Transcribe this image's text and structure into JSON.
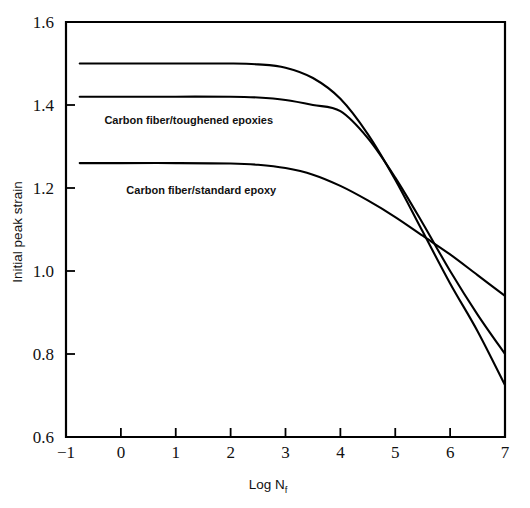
{
  "chart_data": {
    "type": "line",
    "title": "",
    "subtitle": "",
    "xlabel": "Log N",
    "xlabel_subscript": "f",
    "ylabel": "Initial peak strain",
    "xlim": [
      -1,
      7
    ],
    "ylim": [
      0.6,
      1.6
    ],
    "xticks": [
      -1,
      0,
      1,
      2,
      3,
      4,
      5,
      6,
      7
    ],
    "xtick_labels": [
      "−1",
      "0",
      "1",
      "2",
      "3",
      "4",
      "5",
      "6",
      "7"
    ],
    "yticks": [
      0.6,
      0.8,
      1.0,
      1.2,
      1.4,
      1.6
    ],
    "ytick_labels": [
      "0.6",
      "0.8",
      "1.0",
      "1.2",
      "1.4",
      "1.6"
    ],
    "grid": false,
    "legend_position": "inline-annotations",
    "line_color": "#000000",
    "background_color": "#ffffff",
    "annotations": [
      {
        "text": "Carbon fiber/toughened epoxies",
        "x": -0.3,
        "y": 1.355
      },
      {
        "text": "Carbon fiber/standard epoxy",
        "x": 0.1,
        "y": 1.185
      }
    ],
    "series": [
      {
        "name": "Carbon fiber/toughened epoxies (upper)",
        "plateau_value": 1.5,
        "x": [
          -0.75,
          0.0,
          1.0,
          2.0,
          2.5,
          3.0,
          3.5,
          4.0,
          4.5,
          5.0,
          5.5,
          6.0,
          6.5,
          7.0
        ],
        "values": [
          1.5,
          1.5,
          1.5,
          1.5,
          1.498,
          1.49,
          1.465,
          1.415,
          1.33,
          1.22,
          1.095,
          0.97,
          0.855,
          0.725
        ]
      },
      {
        "name": "Carbon fiber/toughened epoxies (lower)",
        "plateau_value": 1.42,
        "x": [
          -0.75,
          0.0,
          1.0,
          2.0,
          2.5,
          3.0,
          3.5,
          4.0,
          4.5,
          5.0,
          5.5,
          6.0,
          6.5,
          7.0
        ],
        "values": [
          1.42,
          1.42,
          1.42,
          1.42,
          1.418,
          1.412,
          1.4,
          1.385,
          1.32,
          1.225,
          1.115,
          1.0,
          0.895,
          0.8
        ]
      },
      {
        "name": "Carbon fiber/standard epoxy",
        "plateau_value": 1.26,
        "x": [
          -0.75,
          0.0,
          1.0,
          2.0,
          2.5,
          3.0,
          3.5,
          4.0,
          4.5,
          5.0,
          5.5,
          6.0,
          6.5,
          7.0
        ],
        "values": [
          1.26,
          1.26,
          1.26,
          1.259,
          1.256,
          1.248,
          1.232,
          1.205,
          1.17,
          1.13,
          1.085,
          1.04,
          0.99,
          0.94
        ]
      }
    ]
  }
}
